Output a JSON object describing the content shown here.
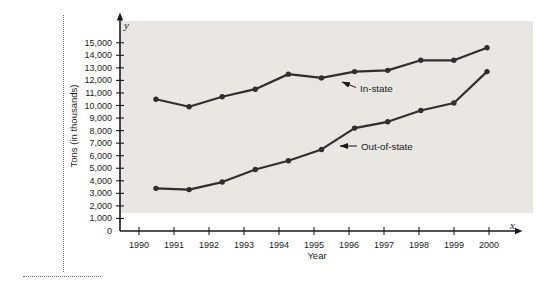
{
  "figure": {
    "axis_symbol_y": "y",
    "axis_symbol_x": "x"
  },
  "colors": {
    "plot_background": "#e8e7e4",
    "line": "#2f2f2f",
    "axis": "#1a1a1a",
    "text": "#1a1a1a"
  },
  "chart_data": {
    "type": "line",
    "title": "",
    "xlabel": "Year",
    "ylabel": "Tons (in thousands)",
    "x": [
      1990,
      1991,
      1992,
      1993,
      1994,
      1995,
      1996,
      1997,
      1998,
      1999,
      2000
    ],
    "series": [
      {
        "name": "In-state",
        "values": [
          10500,
          9900,
          10700,
          11300,
          12500,
          12200,
          12700,
          12800,
          13600,
          13600,
          14600
        ]
      },
      {
        "name": "Out-of-state",
        "values": [
          3400,
          3300,
          3900,
          4900,
          5600,
          6500,
          8200,
          8700,
          9600,
          10200,
          12700
        ]
      }
    ],
    "ylim": [
      0,
      15000
    ],
    "ytick_step": 1000,
    "ytick_labels": [
      "0",
      "1,000",
      "2,000",
      "3,000",
      "4,000",
      "5,000",
      "6,000",
      "7,000",
      "8,000",
      "9,000",
      "10,000",
      "11,000",
      "12,000",
      "13,000",
      "14,000",
      "15,000"
    ],
    "grid": false,
    "legend": "inline-annotations",
    "annotations": [
      {
        "text": "In-state",
        "points_to": "upper line"
      },
      {
        "text": "Out-of-state",
        "points_to": "lower line"
      }
    ]
  }
}
